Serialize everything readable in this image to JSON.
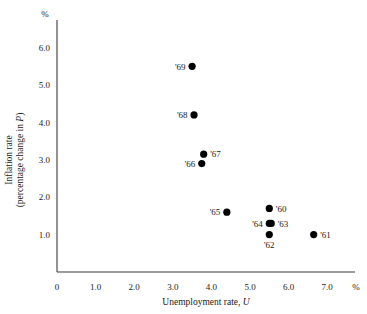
{
  "chart_data": {
    "type": "scatter",
    "title": "",
    "xlabel": "Unemployment rate, U",
    "ylabel": "Inflation rate (percentage change in P)",
    "ylabel_line1": "Inflation rate",
    "ylabel_line2": "(percentage change in P)",
    "x_unit": "%",
    "y_unit": "%",
    "xlim": [
      0,
      7.8
    ],
    "ylim": [
      0,
      6.6
    ],
    "grid": false,
    "legend": "none",
    "x_ticks": [
      "0",
      "1.0",
      "2.0",
      "3.0",
      "4.0",
      "5.0",
      "6.0",
      "7.0"
    ],
    "x_tick_values": [
      0,
      1.0,
      2.0,
      3.0,
      4.0,
      5.0,
      6.0,
      7.0
    ],
    "y_ticks": [
      "1.0",
      "2.0",
      "3.0",
      "4.0",
      "5.0",
      "6.0"
    ],
    "y_tick_values": [
      1.0,
      2.0,
      3.0,
      4.0,
      5.0,
      6.0
    ],
    "points": [
      {
        "label": "'60",
        "x": 5.5,
        "y": 1.7,
        "label_pos": "right"
      },
      {
        "label": "'61",
        "x": 6.65,
        "y": 1.0,
        "label_pos": "right"
      },
      {
        "label": "'62",
        "x": 5.5,
        "y": 1.0,
        "label_pos": "below"
      },
      {
        "label": "'63",
        "x": 5.55,
        "y": 1.3,
        "label_pos": "right"
      },
      {
        "label": "'64",
        "x": 5.5,
        "y": 1.3,
        "label_pos": "left"
      },
      {
        "label": "'65",
        "x": 4.4,
        "y": 1.6,
        "label_pos": "left"
      },
      {
        "label": "'66",
        "x": 3.75,
        "y": 2.9,
        "label_pos": "left"
      },
      {
        "label": "'67",
        "x": 3.8,
        "y": 3.15,
        "label_pos": "right"
      },
      {
        "label": "'68",
        "x": 3.55,
        "y": 4.2,
        "label_pos": "left"
      },
      {
        "label": "'69",
        "x": 3.5,
        "y": 5.5,
        "label_pos": "left"
      }
    ],
    "marker_color": "#000000",
    "axis_color": "#3a3a3a"
  }
}
